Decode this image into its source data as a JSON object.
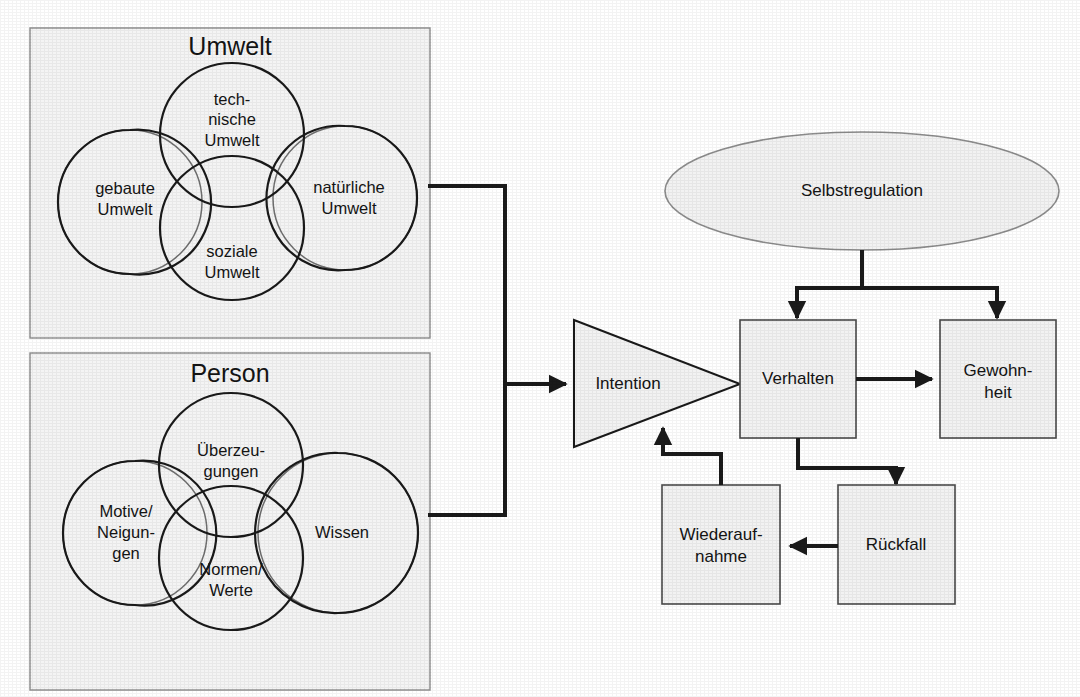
{
  "diagram": {
    "background_color": "#ffffff",
    "line_color": "#1a1a1a",
    "box_fill": "#f2f2f2",
    "group_fill": "#f4f4f4"
  },
  "groups": [
    {
      "id": "umwelt",
      "title": "Umwelt",
      "circles": [
        {
          "id": "technische-umwelt",
          "label_line1": "tech-",
          "label_line2": "nische",
          "label_line3": "Umwelt"
        },
        {
          "id": "gebaute-umwelt",
          "label_line1": "gebaute",
          "label_line2": "Umwelt",
          "label_line3": ""
        },
        {
          "id": "natuerliche-umwelt",
          "label_line1": "natürliche",
          "label_line2": "Umwelt",
          "label_line3": ""
        },
        {
          "id": "soziale-umwelt",
          "label_line1": "soziale",
          "label_line2": "Umwelt",
          "label_line3": ""
        }
      ]
    },
    {
      "id": "person",
      "title": "Person",
      "circles": [
        {
          "id": "ueberzeugungen",
          "label_line1": "Überzeu-",
          "label_line2": "gungen",
          "label_line3": ""
        },
        {
          "id": "motive-neigungen",
          "label_line1": "Motive/",
          "label_line2": "Neigun-",
          "label_line3": "gen"
        },
        {
          "id": "wissen",
          "label_line1": "Wissen",
          "label_line2": "",
          "label_line3": ""
        },
        {
          "id": "normen-werte",
          "label_line1": "Normen/",
          "label_line2": "Werte",
          "label_line3": ""
        }
      ]
    }
  ],
  "nodes": {
    "selbstregulation": {
      "label": "Selbstregulation",
      "shape": "ellipse"
    },
    "intention": {
      "label": "Intention",
      "shape": "triangle"
    },
    "verhalten": {
      "label": "Verhalten",
      "shape": "rect"
    },
    "gewohnheit": {
      "label_line1": "Gewohn-",
      "label_line2": "heit",
      "shape": "rect"
    },
    "wiederaufnahme": {
      "label_line1": "Wiederauf-",
      "label_line2": "nahme",
      "shape": "rect"
    },
    "rueckfall": {
      "label": "Rückfall",
      "shape": "rect"
    }
  },
  "edges": [
    {
      "id": "umwelt-person-to-intention",
      "from": "umwelt + person",
      "to": "intention",
      "arrow": true
    },
    {
      "id": "selbstregulation-to-verhalten",
      "from": "selbstregulation",
      "to": "verhalten",
      "arrow": true
    },
    {
      "id": "selbstregulation-to-gewohnheit",
      "from": "selbstregulation",
      "to": "gewohnheit",
      "arrow": true
    },
    {
      "id": "verhalten-to-gewohnheit",
      "from": "verhalten",
      "to": "gewohnheit",
      "arrow": true
    },
    {
      "id": "verhalten-to-rueckfall",
      "from": "verhalten",
      "to": "rueckfall",
      "arrow": true
    },
    {
      "id": "rueckfall-to-wiederaufnahme",
      "from": "rueckfall",
      "to": "wiederaufnahme",
      "arrow": true
    },
    {
      "id": "wiederaufnahme-to-intention",
      "from": "wiederaufnahme",
      "to": "intention",
      "arrow": true
    }
  ]
}
